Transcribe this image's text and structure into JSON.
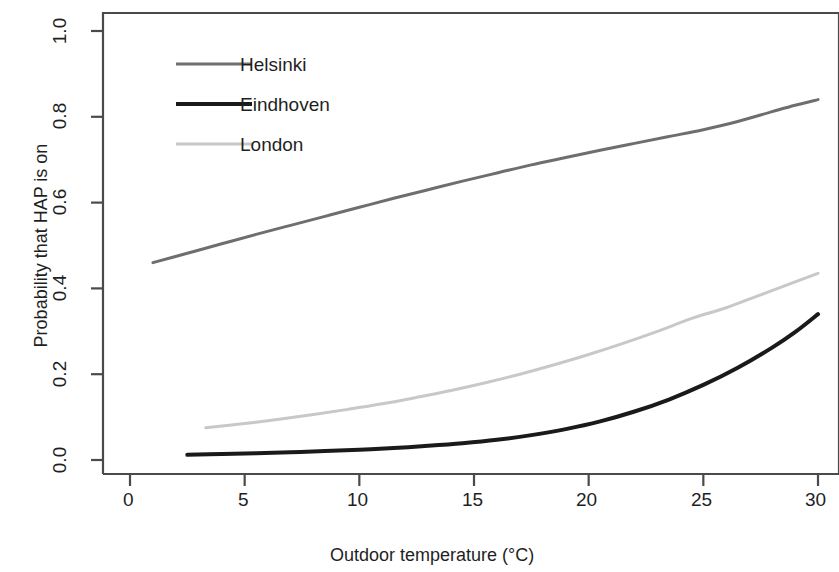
{
  "chart_data": {
    "type": "line",
    "title": "",
    "xlabel": "Outdoor temperature (°C)",
    "ylabel": "Probability that HAP is on",
    "xlim": [
      0,
      30
    ],
    "ylim": [
      0.0,
      1.0
    ],
    "xticks": [
      0,
      5,
      10,
      15,
      20,
      25,
      30
    ],
    "xtick_labels": [
      "0",
      "5",
      "10",
      "15",
      "20",
      "25",
      "30"
    ],
    "yticks": [
      0.0,
      0.2,
      0.4,
      0.6,
      0.8,
      1.0
    ],
    "ytick_labels": [
      "0.0",
      "0.2",
      "0.4",
      "0.6",
      "0.8",
      "1.0"
    ],
    "grid": false,
    "legend_position": "upper left",
    "series": [
      {
        "name": "Helsinki",
        "color": "#6e6e6e",
        "linewidth": 3,
        "x": [
          1.0,
          2.5,
          4.0,
          5.5,
          7.0,
          8.5,
          10.0,
          11.5,
          13.0,
          14.5,
          16.0,
          17.5,
          19.0,
          20.5,
          22.0,
          23.5,
          25.0,
          26.5,
          28.0,
          29.0,
          30.0
        ],
        "y": [
          0.46,
          0.482,
          0.504,
          0.526,
          0.547,
          0.568,
          0.589,
          0.61,
          0.63,
          0.65,
          0.669,
          0.688,
          0.705,
          0.722,
          0.738,
          0.754,
          0.77,
          0.789,
          0.812,
          0.827,
          0.84
        ]
      },
      {
        "name": "Eindhoven",
        "color": "#1a1a1a",
        "linewidth": 4,
        "x": [
          2.5,
          4.0,
          5.5,
          7.0,
          8.5,
          10.0,
          11.5,
          13.0,
          14.5,
          16.0,
          17.5,
          19.0,
          20.5,
          22.0,
          23.5,
          25.0,
          26.5,
          28.0,
          29.0,
          30.0
        ],
        "y": [
          0.012,
          0.014,
          0.016,
          0.018,
          0.021,
          0.024,
          0.028,
          0.033,
          0.039,
          0.047,
          0.058,
          0.072,
          0.09,
          0.113,
          0.141,
          0.175,
          0.215,
          0.262,
          0.298,
          0.34
        ]
      },
      {
        "name": "London",
        "color": "#c8c8c8",
        "linewidth": 3,
        "x": [
          3.3,
          5.0,
          6.5,
          8.0,
          9.5,
          11.0,
          12.5,
          14.0,
          15.5,
          17.0,
          18.5,
          20.0,
          21.5,
          23.0,
          24.5,
          26.0,
          27.5,
          29.0,
          30.0
        ],
        "y": [
          0.075,
          0.085,
          0.095,
          0.106,
          0.118,
          0.131,
          0.146,
          0.162,
          0.18,
          0.2,
          0.222,
          0.246,
          0.272,
          0.3,
          0.33,
          0.355,
          0.385,
          0.415,
          0.435
        ]
      }
    ]
  },
  "axes": {
    "frame_color": "#4a4a4a",
    "tick_color": "#4a4a4a"
  }
}
